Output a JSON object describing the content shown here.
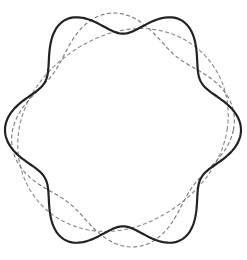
{
  "diagram": {
    "title": "",
    "center": [
      123,
      130
    ],
    "curves": [
      {
        "name": "solid-ring",
        "style": "solid",
        "color": "#222222",
        "width": 2.2,
        "base_radius": 104,
        "amplitude": 14,
        "lobes": 6,
        "phase_deg": 90,
        "rx_scale": 1.0,
        "ry_scale": 1.07,
        "rot_deg": 0
      },
      {
        "name": "dashed-ring-a",
        "style": "dashed",
        "color": "#777777",
        "width": 1.1,
        "base_radius": 100,
        "amplitude": 12,
        "lobes": 4,
        "phase_deg": 60,
        "rx_scale": 1.0,
        "ry_scale": 1.05,
        "rot_deg": 0
      },
      {
        "name": "dashed-ring-b",
        "style": "dashed",
        "color": "#888888",
        "width": 1.1,
        "base_radius": 101,
        "amplitude": 9,
        "lobes": 2,
        "phase_deg": 20,
        "rx_scale": 1.0,
        "ry_scale": 1.02,
        "rot_deg": 0
      }
    ]
  }
}
